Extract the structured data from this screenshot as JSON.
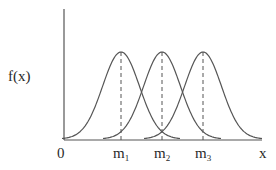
{
  "chart_data": {
    "type": "line",
    "title": "",
    "xlabel": "x",
    "ylabel": "f(x)",
    "origin_label": "0",
    "x_tick_labels": [
      {
        "base": "m",
        "sub": "1"
      },
      {
        "base": "m",
        "sub": "2"
      },
      {
        "base": "m",
        "sub": "3"
      }
    ],
    "series": [
      {
        "name": "f1",
        "shape": "gaussian",
        "mean_label": "m1",
        "mean": 1,
        "sigma": 0.45
      },
      {
        "name": "f2",
        "shape": "gaussian",
        "mean_label": "m2",
        "mean": 2,
        "sigma": 0.45
      },
      {
        "name": "f3",
        "shape": "gaussian",
        "mean_label": "m3",
        "mean": 3,
        "sigma": 0.45
      }
    ],
    "mean_markers": "dashed vertical lines from each peak to the x-axis",
    "grid": false,
    "legend": "none"
  },
  "colors": {
    "curve": "#555555",
    "axis": "#555555",
    "text": "#2a2a2a"
  }
}
